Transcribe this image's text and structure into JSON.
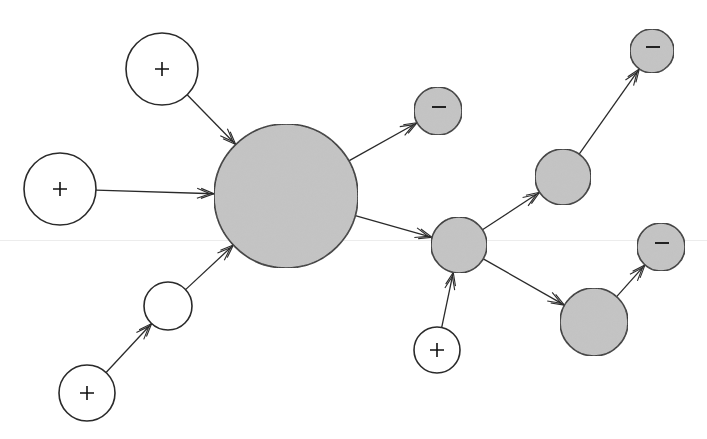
{
  "diagram": {
    "title": "",
    "colors": {
      "positive_fill": "#ffffff",
      "internal_fill": "#ffffff",
      "hub_fill": "#c4c4c4",
      "negative_fill": "#c4c4c4",
      "stroke": "#2a2a2a",
      "background": "#ffffff"
    },
    "nodes": [
      {
        "id": "hub",
        "cx": 286,
        "cy": 196,
        "r": 72,
        "fill": "gray",
        "label": ""
      },
      {
        "id": "pos-top-left",
        "cx": 162,
        "cy": 69,
        "r": 36,
        "fill": "white",
        "label": "+"
      },
      {
        "id": "pos-left",
        "cx": 60,
        "cy": 189,
        "r": 36,
        "fill": "white",
        "label": "+"
      },
      {
        "id": "internal-white",
        "cx": 168,
        "cy": 306,
        "r": 24,
        "fill": "white",
        "label": ""
      },
      {
        "id": "pos-bottom-left",
        "cx": 87,
        "cy": 393,
        "r": 28,
        "fill": "white",
        "label": "+"
      },
      {
        "id": "neg-near-hub",
        "cx": 438,
        "cy": 111,
        "r": 24,
        "fill": "gray",
        "label": "−"
      },
      {
        "id": "mid-gray",
        "cx": 459,
        "cy": 245,
        "r": 28,
        "fill": "gray",
        "label": ""
      },
      {
        "id": "upper-right-gray",
        "cx": 563,
        "cy": 177,
        "r": 28,
        "fill": "gray",
        "label": ""
      },
      {
        "id": "neg-top-right",
        "cx": 652,
        "cy": 51,
        "r": 22,
        "fill": "gray",
        "label": "−"
      },
      {
        "id": "lower-right-gray",
        "cx": 594,
        "cy": 322,
        "r": 34,
        "fill": "gray",
        "label": ""
      },
      {
        "id": "neg-right",
        "cx": 661,
        "cy": 247,
        "r": 24,
        "fill": "gray",
        "label": "−"
      },
      {
        "id": "pos-bottom",
        "cx": 437,
        "cy": 350,
        "r": 23,
        "fill": "white",
        "label": "+"
      }
    ],
    "edges": [
      {
        "from": "pos-top-left",
        "to": "hub"
      },
      {
        "from": "pos-left",
        "to": "hub"
      },
      {
        "from": "internal-white",
        "to": "hub"
      },
      {
        "from": "pos-bottom-left",
        "to": "internal-white"
      },
      {
        "from": "hub",
        "to": "neg-near-hub"
      },
      {
        "from": "hub",
        "to": "mid-gray"
      },
      {
        "from": "mid-gray",
        "to": "upper-right-gray"
      },
      {
        "from": "upper-right-gray",
        "to": "neg-top-right"
      },
      {
        "from": "mid-gray",
        "to": "lower-right-gray"
      },
      {
        "from": "lower-right-gray",
        "to": "neg-right"
      },
      {
        "from": "pos-bottom",
        "to": "mid-gray"
      }
    ]
  }
}
